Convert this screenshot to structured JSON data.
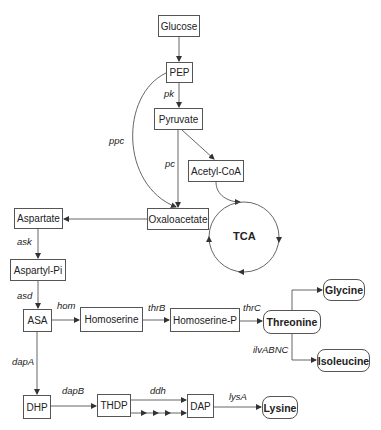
{
  "diagram": {
    "nodes": {
      "glucose": "Glucose",
      "pep": "PEP",
      "pyruvate": "Pyruvate",
      "acetyl_coa": "Acetyl-CoA",
      "oxaloacetate": "Oxaloacetate",
      "aspartate": "Aspartate",
      "aspartyl_pi": "Aspartyl-Pi",
      "asa": "ASA",
      "homoserine": "Homoserine",
      "homoserine_p": "Homoserine-P",
      "threonine": "Threonine",
      "glycine": "Glycine",
      "isoleucine": "Isoleucine",
      "dhp": "DHP",
      "thdp": "THDP",
      "dap": "DAP",
      "lysine": "Lysine"
    },
    "cycle_label": "TCA",
    "enzymes": {
      "pk": "pk",
      "ppc": "ppc",
      "pc": "pc",
      "ask": "ask",
      "asd": "asd",
      "hom": "hom",
      "thrB": "thrB",
      "thrC": "thrC",
      "ilvABNC": "ilvABNC",
      "dapA": "dapA",
      "dapB": "dapB",
      "ddh": "ddh",
      "lysA": "lysA"
    },
    "edges": [
      {
        "from": "Glucose",
        "to": "PEP"
      },
      {
        "from": "PEP",
        "to": "Pyruvate",
        "enzyme": "pk"
      },
      {
        "from": "PEP",
        "to": "Oxaloacetate",
        "enzyme": "ppc"
      },
      {
        "from": "Pyruvate",
        "to": "Oxaloacetate",
        "enzyme": "pc"
      },
      {
        "from": "Pyruvate",
        "to": "Acetyl-CoA"
      },
      {
        "from": "Acetyl-CoA",
        "to": "TCA"
      },
      {
        "from": "Oxaloacetate",
        "to": "Aspartate"
      },
      {
        "from": "Aspartate",
        "to": "Aspartyl-Pi",
        "enzyme": "ask"
      },
      {
        "from": "Aspartyl-Pi",
        "to": "ASA",
        "enzyme": "asd"
      },
      {
        "from": "ASA",
        "to": "Homoserine",
        "enzyme": "hom"
      },
      {
        "from": "Homoserine",
        "to": "Homoserine-P",
        "enzyme": "thrB"
      },
      {
        "from": "Homoserine-P",
        "to": "Threonine",
        "enzyme": "thrC"
      },
      {
        "from": "Threonine",
        "to": "Glycine"
      },
      {
        "from": "Threonine",
        "to": "Isoleucine",
        "enzyme": "ilvABNC"
      },
      {
        "from": "ASA",
        "to": "DHP",
        "enzyme": "dapA"
      },
      {
        "from": "DHP",
        "to": "THDP",
        "enzyme": "dapB"
      },
      {
        "from": "THDP",
        "to": "DAP",
        "enzyme": "ddh"
      },
      {
        "from": "THDP",
        "to": "DAP",
        "style": "multi-step"
      },
      {
        "from": "DAP",
        "to": "Lysine",
        "enzyme": "lysA"
      }
    ],
    "colors": {
      "stroke": "#555555",
      "text": "#222222",
      "background": "#ffffff"
    }
  }
}
